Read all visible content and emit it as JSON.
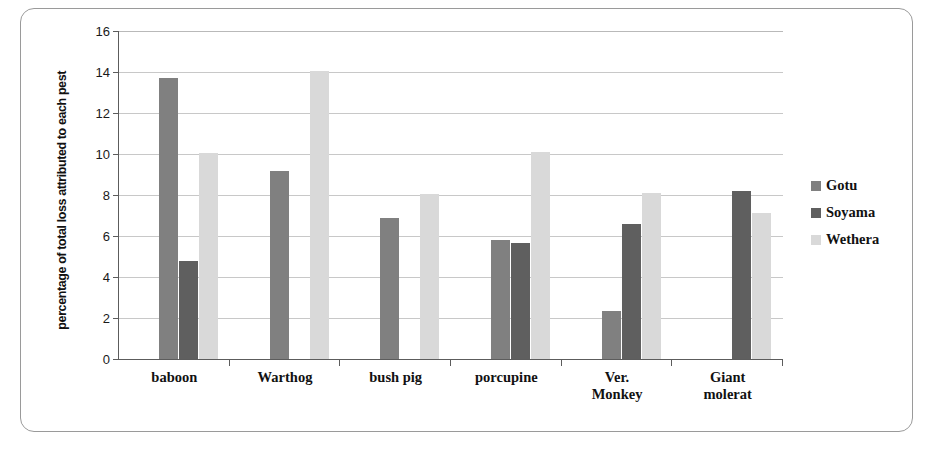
{
  "chart_data": {
    "type": "bar",
    "title": "",
    "xlabel": "",
    "ylabel": "percentage of total loss attributed to each pest",
    "ylim": [
      0,
      16
    ],
    "ytick_step": 2,
    "ytick_labels": [
      "16",
      "14",
      "12",
      "10",
      "8",
      "6",
      "4",
      "2",
      "0"
    ],
    "grid": true,
    "legend_position": "right",
    "categories": [
      "baboon",
      "Warthog",
      "bush pig",
      "porcupine",
      "Ver. Monkey",
      "Giant molerat"
    ],
    "category_lines": [
      [
        "baboon"
      ],
      [
        "Warthog"
      ],
      [
        "bush pig"
      ],
      [
        "porcupine"
      ],
      [
        "Ver.",
        "Monkey"
      ],
      [
        "Giant",
        "molerat"
      ]
    ],
    "series": [
      {
        "name": "Gotu",
        "color": "#808080",
        "values": [
          13.7,
          9.15,
          6.9,
          5.8,
          2.35,
          null
        ]
      },
      {
        "name": "Soyama",
        "color": "#5f5f5f",
        "values": [
          4.8,
          null,
          null,
          5.65,
          6.6,
          8.2
        ]
      },
      {
        "name": "Wethera",
        "color": "#d9d9d9",
        "values": [
          10.05,
          14.05,
          8.05,
          10.1,
          8.1,
          7.1
        ]
      }
    ]
  },
  "legend": {
    "entries": [
      {
        "label": "Gotu",
        "color": "#808080"
      },
      {
        "label": "Soyama",
        "color": "#5f5f5f"
      },
      {
        "label": "Wethera",
        "color": "#d9d9d9"
      }
    ]
  }
}
